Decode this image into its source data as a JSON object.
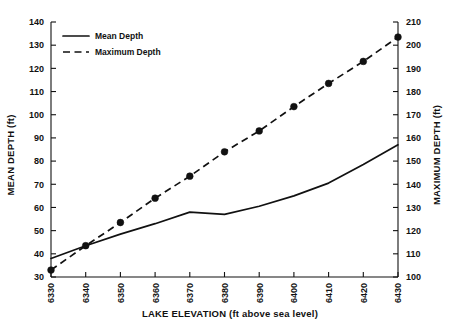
{
  "chart_data": {
    "type": "line",
    "title": "",
    "xlabel": "LAKE ELEVATION (ft above sea level)",
    "ylabel": "MEAN DEPTH (ft)",
    "y2label": "MAXIMUM DEPTH (ft)",
    "x": [
      6330,
      6340,
      6350,
      6360,
      6370,
      6380,
      6390,
      6400,
      6410,
      6420,
      6430
    ],
    "xlim": [
      6330,
      6430
    ],
    "ylim": [
      30,
      140
    ],
    "y2lim": [
      100,
      210
    ],
    "xticks": [
      "6330",
      "6340",
      "6350",
      "6360",
      "6370",
      "6380",
      "6390",
      "6400",
      "6410",
      "6420",
      "6430"
    ],
    "yticks": [
      "30",
      "40",
      "50",
      "60",
      "70",
      "80",
      "90",
      "100",
      "110",
      "120",
      "130",
      "140"
    ],
    "y2ticks": [
      "100",
      "110",
      "120",
      "130",
      "140",
      "150",
      "160",
      "170",
      "180",
      "190",
      "200",
      "210"
    ],
    "grid": false,
    "legend_position": "upper-left",
    "series": [
      {
        "name": "Mean Depth",
        "axis": "left",
        "style": "solid",
        "markers": false,
        "values": [
          38.0,
          43.5,
          48.5,
          53.0,
          58.0,
          57.0,
          60.5,
          65.0,
          70.5,
          78.5,
          87.0
        ]
      },
      {
        "name": "Maximum Depth",
        "axis": "right",
        "style": "dashed",
        "markers": true,
        "values": [
          103.0,
          113.5,
          123.5,
          134.0,
          143.5,
          154.0,
          163.0,
          173.5,
          183.5,
          193.0,
          203.5
        ]
      }
    ],
    "legend": [
      {
        "label": "Mean Depth",
        "style": "solid"
      },
      {
        "label": "Maximum Depth",
        "style": "dashed"
      }
    ]
  }
}
